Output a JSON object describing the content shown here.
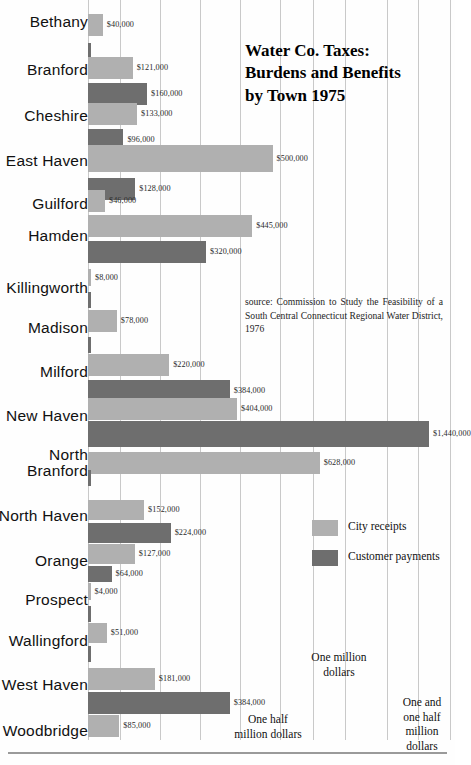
{
  "chart_data": {
    "type": "bar",
    "orientation": "horizontal",
    "title": "Water Co. Taxes: Burdens and Benefits by Town 1975",
    "title_lines": [
      "Water Co. Taxes:",
      "Burdens and Benefits",
      "by Town 1975"
    ],
    "xlabel": "",
    "ylabel": "",
    "grid": true,
    "legend_position": "right-middle",
    "xlim": [
      0,
      1440000
    ],
    "value_prefix": "$",
    "categories": [
      "Bethany",
      "Branford",
      "Cheshire",
      "East Haven",
      "Guilford",
      "Hamden",
      "Killingworth",
      "Madison",
      "Milford",
      "New Haven",
      "North Branford",
      "North Haven",
      "Orange",
      "Prospect",
      "Wallingford",
      "West Haven",
      "Woodbridge"
    ],
    "series": [
      {
        "name": "City receipts",
        "color": "#b0b0b0",
        "values": [
          40000,
          121000,
          133000,
          500000,
          46000,
          445000,
          8000,
          78000,
          220000,
          404000,
          628000,
          152000,
          127000,
          4000,
          51000,
          181000,
          85000
        ],
        "labels": [
          "$40,000",
          "$121,000",
          "$133,000",
          "$500,000",
          "$46,000",
          "$445,000",
          "$8,000",
          "$78,000",
          "$220,000",
          "$404,000",
          "$628,000",
          "$152,000",
          "$127,000",
          "$4,000",
          "$51,000",
          "$181,000",
          "$85,000"
        ]
      },
      {
        "name": "Customer payments",
        "color": "#6e6e6e",
        "values": [
          1000,
          160000,
          96000,
          128000,
          0,
          320000,
          1000,
          1000,
          384000,
          1440000,
          1000,
          224000,
          64000,
          1000,
          1000,
          384000,
          0
        ],
        "labels": [
          "",
          "$160,000",
          "$96,000",
          "$128,000",
          "",
          "$320,000",
          "",
          "",
          "$384,000",
          "$1,440,000",
          "",
          "$224,000",
          "$64,000",
          "",
          "",
          "$384,000",
          ""
        ]
      }
    ],
    "axis_notes": [
      {
        "text": "One half million dollars",
        "lines": [
          "One half",
          "million dollars"
        ],
        "value": 500000
      },
      {
        "text": "One million dollars",
        "lines": [
          "One million",
          "dollars"
        ],
        "value": 1000000
      },
      {
        "text": "One and one half million dollars",
        "lines": [
          "One and",
          "one half",
          "million",
          "dollars"
        ],
        "value": 1500000
      }
    ]
  },
  "source": {
    "text": "source: Commission to Study the Feasibility of a South Central Connecticut Regional Water District, 1976"
  },
  "legend": {
    "items": [
      {
        "label": "City receipts",
        "color": "#b0b0b0"
      },
      {
        "label": "Customer payments",
        "color": "#6e6e6e"
      }
    ]
  },
  "colors": {
    "light_bar": "#b0b0b0",
    "dark_bar": "#6e6e6e",
    "gridline": "#c9c9c9",
    "text": "#1a1a1a",
    "background": "#ffffff"
  }
}
